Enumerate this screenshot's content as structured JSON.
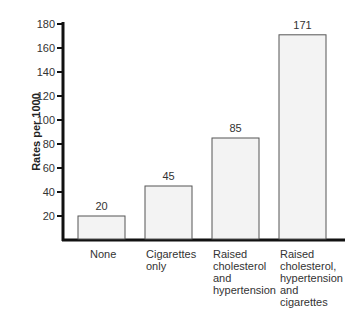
{
  "chart_data": {
    "type": "bar",
    "title": "",
    "xlabel": "",
    "ylabel": "Rates per 1000",
    "ylim": [
      0,
      180
    ],
    "yticks": [
      20,
      40,
      60,
      80,
      100,
      120,
      140,
      160,
      180
    ],
    "categories": [
      "None",
      "Cigarettes only",
      "Raised cholesterol and hypertension",
      "Raised cholesterol, hypertension and cigarettes"
    ],
    "category_lines": [
      [
        "None"
      ],
      [
        "Cigarettes",
        "only"
      ],
      [
        "Raised",
        "cholesterol",
        "and",
        "hypertension"
      ],
      [
        "Raised",
        "cholesterol,",
        "hypertension",
        "and",
        "cigarettes"
      ]
    ],
    "values": [
      20,
      45,
      85,
      171
    ],
    "data_labels": [
      "20",
      "45",
      "85",
      "171"
    ],
    "grid": false,
    "legend": null
  },
  "colors": {
    "bar_fill": "#f3f3f3",
    "bar_stroke": "#555555",
    "axis": "#111111"
  }
}
